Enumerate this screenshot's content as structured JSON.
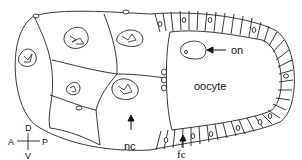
{
  "diagram": {
    "labels": {
      "oocyte_nucleus": "on",
      "oocyte": "oocyte",
      "nurse_cells": "nc",
      "follicle_cells": "fc"
    },
    "axes": {
      "dorsal": "D",
      "ventral": "V",
      "anterior": "A",
      "posterior": "P"
    }
  }
}
